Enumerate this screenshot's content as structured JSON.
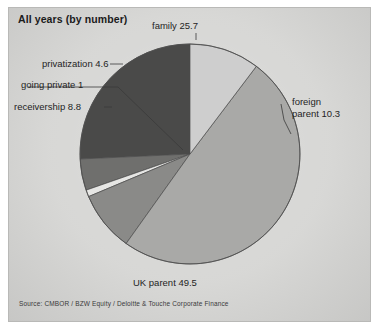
{
  "chart_title": "All years (by number)",
  "source_note": "Source: CMBOR / BZW Equity / Deloitte & Touche Corporate Finance",
  "labels": {
    "family": "family 25.7",
    "foreign_parent": "foreign parent 10.3",
    "foreign_parent_line1": "foreign",
    "foreign_parent_line2": "parent 10.3",
    "uk_parent": "UK parent 49.5",
    "receivership": "receivership 8.8",
    "going_private": "going private 1",
    "privatization": "privatization 4.6"
  },
  "chart_data": {
    "type": "pie",
    "title": "All years (by number)",
    "subtitle": "",
    "xlabel": "",
    "ylabel": "",
    "unit": "percent",
    "legend_position": "none",
    "labels_inline": true,
    "grid": false,
    "total": 99.9,
    "start_angle_deg": -90,
    "direction": "counterclockwise",
    "categories": [
      "UK parent",
      "receivership",
      "going private",
      "privatization",
      "family",
      "foreign parent"
    ],
    "values": [
      49.5,
      8.8,
      1,
      4.6,
      25.7,
      10.3
    ],
    "slices": [
      {
        "label": "UK parent",
        "value": 49.5,
        "display": "UK parent 49.5",
        "color": "#a9a9a7"
      },
      {
        "label": "receivership",
        "value": 8.8,
        "display": "receivership 8.8",
        "color": "#8a8a88"
      },
      {
        "label": "going private",
        "value": 1,
        "display": "going private 1",
        "color": "#e6e6e4"
      },
      {
        "label": "privatization",
        "value": 4.6,
        "display": "privatization 4.6",
        "color": "#6f6f6d"
      },
      {
        "label": "family",
        "value": 25.7,
        "display": "family 25.7",
        "color": "#4a4a49"
      },
      {
        "label": "foreign parent",
        "value": 10.3,
        "display": "foreign parent 10.3",
        "color": "#cecece"
      }
    ],
    "source": "Source: CMBOR / BZW Equity / Deloitte & Touche Corporate Finance"
  },
  "colors": {
    "plate_background": "#d6d6d4",
    "family": "#4a4a49",
    "foreign_parent": "#cecece",
    "uk_parent": "#a9a9a7",
    "receivership": "#8a8a88",
    "going_private": "#e6e6e4",
    "privatization": "#6f6f6d",
    "text": "#242424",
    "outline": "#4c4c4c"
  }
}
